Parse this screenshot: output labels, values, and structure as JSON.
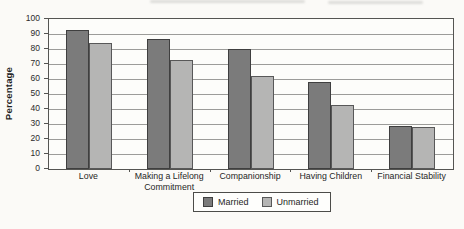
{
  "chart_data": {
    "type": "bar",
    "title": "",
    "categories": [
      "Love",
      "Making a Lifelong Commitment",
      "Companionship",
      "Having Children",
      "Financial Stability"
    ],
    "series": [
      {
        "name": "Married",
        "color": "#7b7b7b",
        "border_color": "#3f3f3f",
        "values": [
          93,
          87,
          80,
          58,
          29
        ]
      },
      {
        "name": "Unmarried",
        "color": "#b5b5b4",
        "border_color": "#585858",
        "values": [
          84,
          73,
          62,
          43,
          28
        ]
      }
    ],
    "xlabel": "",
    "ylabel": "Percentage",
    "ylim": [
      0,
      100
    ],
    "y_ticks": [
      0,
      10,
      20,
      30,
      40,
      50,
      60,
      70,
      80,
      90,
      100
    ],
    "grid": true,
    "legend_position": "bottom",
    "plot_background": "#fdfdfa",
    "gridline_color": "#9c9c99"
  }
}
